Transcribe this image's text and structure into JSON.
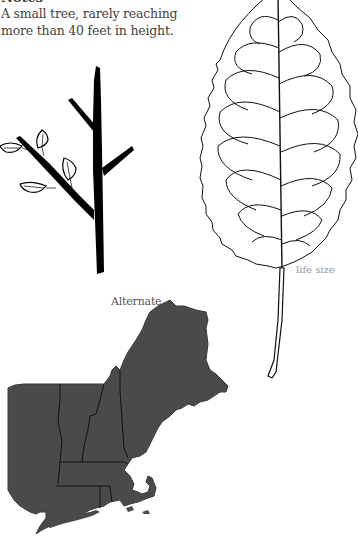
{
  "notes": {
    "heading": "Notes",
    "text": "A small tree, rarely reaching more than 40 feet in height."
  },
  "twig": {
    "caption": "Alternate.",
    "arrangement": "alternate"
  },
  "leaf": {
    "caption": "life size"
  },
  "map": {
    "region": "New England range map",
    "fill_color": "#4a4a4a",
    "border_color": "#111111"
  },
  "icons": {
    "twig": "twig-illustration",
    "leaf": "leaf-illustration",
    "map": "range-map"
  }
}
